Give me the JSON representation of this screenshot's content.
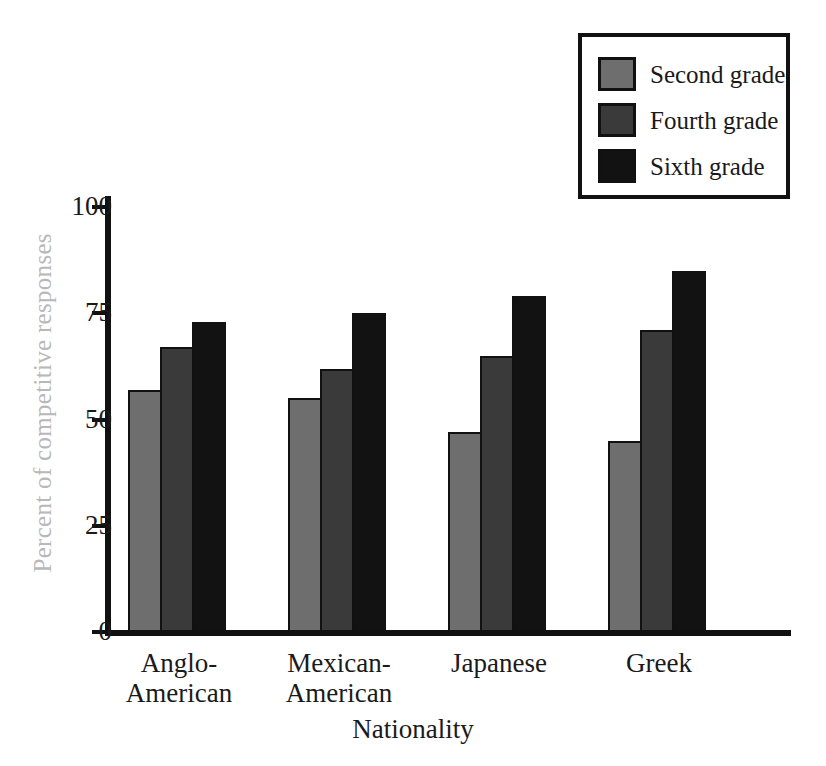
{
  "chart_data": {
    "type": "bar",
    "title": "",
    "xlabel": "Nationality",
    "ylabel": "Percent of competitive responses",
    "categories": [
      "Anglo-American",
      "Mexican-American",
      "Japanese",
      "Greek"
    ],
    "series": [
      {
        "name": "Second grade",
        "color": "#6e6e6e",
        "values": [
          57,
          55,
          47,
          45
        ]
      },
      {
        "name": "Fourth grade",
        "color": "#3a3a3a",
        "values": [
          67,
          62,
          65,
          71
        ]
      },
      {
        "name": "Sixth grade",
        "color": "#121212",
        "values": [
          73,
          75,
          79,
          85
        ]
      }
    ],
    "ylim": [
      0,
      100
    ],
    "yticks": [
      0,
      25,
      50,
      75,
      100
    ],
    "ytick_labels": [
      "0",
      "25",
      "50",
      "75",
      "100"
    ],
    "grid": false,
    "legend_position": "top-right"
  },
  "axes": {
    "y_title": "Percent of competitive responses",
    "x_title": "Nationality",
    "ticks": [
      {
        "label": "100",
        "value": 100
      },
      {
        "label": "75",
        "value": 75
      },
      {
        "label": "50",
        "value": 50
      },
      {
        "label": "25",
        "value": 25
      },
      {
        "label": "0",
        "value": 0
      }
    ]
  },
  "legend": {
    "items": [
      {
        "label": "Second grade",
        "swatch": "#6e6e6e"
      },
      {
        "label": "Fourth grade",
        "swatch": "#3a3a3a"
      },
      {
        "label": "Sixth grade",
        "swatch": "#121212"
      }
    ]
  },
  "groups": [
    {
      "label": "Anglo-\nAmerican",
      "label_flat": "Anglo-American"
    },
    {
      "label": "Mexican-\nAmerican",
      "label_flat": "Mexican-American"
    },
    {
      "label": "Japanese",
      "label_flat": "Japanese"
    },
    {
      "label": "Greek",
      "label_flat": "Greek"
    }
  ]
}
